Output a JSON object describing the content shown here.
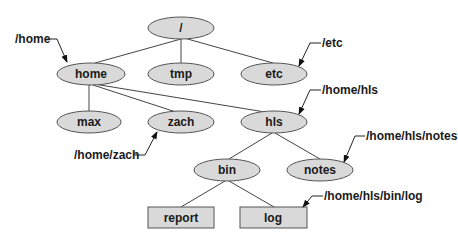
{
  "diagram": {
    "type": "directory-tree",
    "colors": {
      "node_fill": "#d9d9d9",
      "node_stroke": "#555555",
      "edge": "#444444",
      "text": "#1a1a1a"
    },
    "nodes": [
      {
        "id": "root",
        "label": "/",
        "shape": "ellipse",
        "cx": 181,
        "cy": 28
      },
      {
        "id": "home",
        "label": "home",
        "shape": "ellipse",
        "cx": 91,
        "cy": 74
      },
      {
        "id": "tmp",
        "label": "tmp",
        "shape": "ellipse",
        "cx": 181,
        "cy": 74
      },
      {
        "id": "etc",
        "label": "etc",
        "shape": "ellipse",
        "cx": 274,
        "cy": 74
      },
      {
        "id": "max",
        "label": "max",
        "shape": "ellipse",
        "cx": 89,
        "cy": 122
      },
      {
        "id": "zach",
        "label": "zach",
        "shape": "ellipse",
        "cx": 181,
        "cy": 122
      },
      {
        "id": "hls",
        "label": "hls",
        "shape": "ellipse",
        "cx": 274,
        "cy": 122
      },
      {
        "id": "bin",
        "label": "bin",
        "shape": "ellipse",
        "cx": 227,
        "cy": 170
      },
      {
        "id": "notes",
        "label": "notes",
        "shape": "ellipse",
        "cx": 320,
        "cy": 170
      },
      {
        "id": "report",
        "label": "report",
        "shape": "rect",
        "cx": 181,
        "cy": 217
      },
      {
        "id": "log",
        "label": "log",
        "shape": "rect",
        "cx": 273,
        "cy": 217
      }
    ],
    "edges": [
      [
        "root",
        "home"
      ],
      [
        "root",
        "tmp"
      ],
      [
        "root",
        "etc"
      ],
      [
        "home",
        "max"
      ],
      [
        "home",
        "zach"
      ],
      [
        "home",
        "hls"
      ],
      [
        "hls",
        "bin"
      ],
      [
        "hls",
        "notes"
      ],
      [
        "bin",
        "report"
      ],
      [
        "bin",
        "log"
      ]
    ],
    "path_labels": [
      {
        "id": "home",
        "text": "/home"
      },
      {
        "id": "etc",
        "text": "/etc"
      },
      {
        "id": "hls",
        "text": "/home/hls"
      },
      {
        "id": "zach",
        "text": "/home/zach"
      },
      {
        "id": "notes",
        "text": "/home/hls/notes"
      },
      {
        "id": "log",
        "text": "/home/hls/bin/log"
      }
    ]
  }
}
